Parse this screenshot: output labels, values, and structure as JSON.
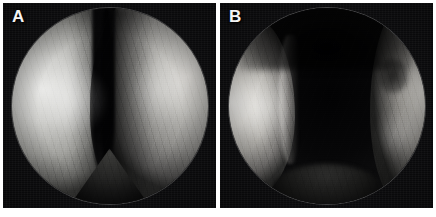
{
  "figure": {
    "name": "two-panel-endoscopic-figure",
    "width": 436,
    "height": 217,
    "background_color": "#ffffff",
    "layout": "two side-by-side square panels separated by a thin white gutter",
    "modality": "endoscopy",
    "color_mode": "grayscale"
  },
  "panels": [
    {
      "id": "A",
      "label": "A",
      "label_color": "#f4f4f4",
      "frame_color": "#0a0a0a",
      "aperture": "circular",
      "description": "Endoscopic view showing a narrow slit-like central lumen between two bulging mucosal walls",
      "features": {
        "left_wall": "broad bright convex mucosal mass filling the left half",
        "right_wall": "paler convex mucosal wall on the right",
        "center": "narrow dark vertical cleft (near-collapsed lumen)",
        "inferior": "dark triangular apex at the lower midline"
      }
    },
    {
      "id": "B",
      "label": "B",
      "label_color": "#f4f4f4",
      "frame_color": "#0a0a0a",
      "aperture": "circular",
      "description": "Endoscopic view showing a wide patent dark central lumen flanked by retracted mucosal flaps",
      "features": {
        "left_wall": "bright retracted mucosal flap along the left margin",
        "right_wall": "grey mucosal flap along the right margin with a dark notch",
        "center": "large dark open lumen occupying the middle of the field",
        "superior": "dark shadowed roof across the upper field"
      }
    }
  ],
  "palette": {
    "page_background": "#ffffff",
    "panel_background": "#0a0a0a",
    "tissue_highlight": "#f2f1ee",
    "tissue_midtone": "#a3a39f",
    "tissue_shadow": "#2e2e2d",
    "lumen_dark": "#020203",
    "label_text": "#f4f4f4",
    "aperture_rim": "#bebebe"
  }
}
